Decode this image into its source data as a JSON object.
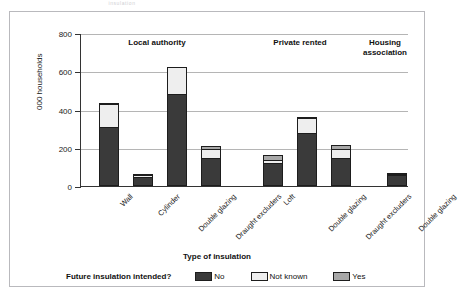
{
  "cropped_header_text": "insulation",
  "chart_data": {
    "type": "bar",
    "subtype": "stacked",
    "title": "",
    "xlabel": "Type of insulation",
    "ylabel": "000 households",
    "ylim": [
      0,
      800
    ],
    "yticks": [
      0,
      200,
      400,
      600,
      800
    ],
    "grid": true,
    "legend_position": "bottom",
    "legend_title": "Future insulation intended?",
    "categories": [
      "Wall",
      "Cylinder",
      "Double glazing",
      "Draught excluders",
      "Loft",
      "Double glazing",
      "Draught excluders",
      "Double glazing"
    ],
    "groups": [
      {
        "label": "Local authority",
        "categories": [
          "Wall",
          "Cylinder",
          "Double glazing",
          "Draught excluders"
        ]
      },
      {
        "label": "Private rented",
        "categories": [
          "Loft",
          "Double glazing",
          "Draught excluders"
        ]
      },
      {
        "label": "Housing\nassociation",
        "categories": [
          "Double glazing"
        ]
      }
    ],
    "series": [
      {
        "name": "No",
        "color": "#3a3a3a",
        "values": [
          310,
          45,
          480,
          148,
          120,
          275,
          145,
          58
        ]
      },
      {
        "name": "Not known",
        "color": "#eeeeee",
        "values": [
          122,
          18,
          145,
          52,
          22,
          88,
          52,
          10
        ]
      },
      {
        "name": "Yes",
        "color": "#a8a8a8",
        "values": [
          12,
          8,
          0,
          20,
          32,
          4,
          30,
          5
        ]
      }
    ],
    "totals": [
      444,
      71,
      625,
      220,
      174,
      367,
      227,
      73
    ],
    "bars": [
      {
        "category": "Wall",
        "group": "Local authority",
        "no": 310,
        "not_known": 122,
        "yes": 12,
        "total": 444
      },
      {
        "category": "Cylinder",
        "group": "Local authority",
        "no": 45,
        "not_known": 18,
        "yes": 8,
        "total": 71
      },
      {
        "category": "Double glazing",
        "group": "Local authority",
        "no": 480,
        "not_known": 145,
        "yes": 0,
        "total": 625
      },
      {
        "category": "Draught excluders",
        "group": "Local authority",
        "no": 148,
        "not_known": 52,
        "yes": 20,
        "total": 220
      },
      {
        "category": "Loft",
        "group": "Private rented",
        "no": 120,
        "not_known": 22,
        "yes": 32,
        "total": 174
      },
      {
        "category": "Double glazing",
        "group": "Private rented",
        "no": 275,
        "not_known": 88,
        "yes": 4,
        "total": 367
      },
      {
        "category": "Draught excluders",
        "group": "Private rented",
        "no": 145,
        "not_known": 52,
        "yes": 30,
        "total": 227
      },
      {
        "category": "Double glazing",
        "group": "Housing association",
        "no": 58,
        "not_known": 10,
        "yes": 5,
        "total": 73
      }
    ]
  },
  "legend": {
    "title": "Future insulation intended?",
    "items": [
      {
        "label": "No",
        "color": "#3a3a3a"
      },
      {
        "label": "Not known",
        "color": "#eeeeee"
      },
      {
        "label": "Yes",
        "color": "#a8a8a8"
      }
    ]
  }
}
